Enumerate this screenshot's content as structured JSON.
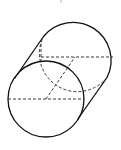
{
  "diagram": {
    "type": "oblique-cylinder",
    "front_circle": {
      "cx": 46,
      "cy": 99,
      "r": 38
    },
    "back_circle": {
      "cx": 75,
      "cy": 57,
      "r": 38
    },
    "stroke_color": "#111111",
    "background": "#ffffff"
  }
}
